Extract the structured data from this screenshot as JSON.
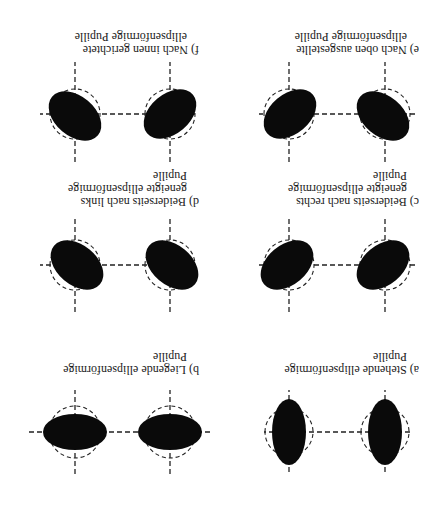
{
  "figure": {
    "orientation": "rotated-180",
    "panels": [
      {
        "id": "a",
        "caption_lines": [
          "a) Stehende ellipsenförmige",
          "Pupille"
        ],
        "shape": "vertical-ellipse",
        "tilt_left_deg": 0,
        "tilt_right_deg": 0
      },
      {
        "id": "b",
        "caption_lines": [
          "b) Liegende ellipsenförmige",
          "Pupille"
        ],
        "shape": "horizontal-ellipse",
        "tilt_left_deg": 0,
        "tilt_right_deg": 0
      },
      {
        "id": "c",
        "caption_lines": [
          "c) Beiderseits nach rechts",
          "geneigte ellipsenförmige",
          "Pupille"
        ],
        "shape": "tilted-ellipse",
        "tilt_left_deg": -40,
        "tilt_right_deg": -40
      },
      {
        "id": "d",
        "caption_lines": [
          "d) Beiderseits nach links",
          "geneigte ellipsenförmige",
          "Pupille"
        ],
        "shape": "tilted-ellipse",
        "tilt_left_deg": 40,
        "tilt_right_deg": 40
      },
      {
        "id": "e",
        "caption_lines": [
          "e) Nach oben ausgestellte",
          "ellipsenförmige Pupille"
        ],
        "shape": "tilted-ellipse",
        "tilt_left_deg": 40,
        "tilt_right_deg": -40
      },
      {
        "id": "f",
        "caption_lines": [
          "f) Nach innen gerichtete",
          "ellipsenförmige Pupille"
        ],
        "shape": "tilted-ellipse",
        "tilt_left_deg": -40,
        "tilt_right_deg": 40
      }
    ]
  }
}
